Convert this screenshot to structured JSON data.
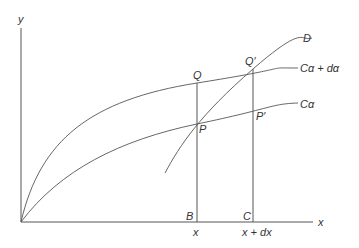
{
  "diagram": {
    "axes": {
      "x_label": "x",
      "y_label": "y"
    },
    "curves": [
      {
        "id": "c_alpha",
        "label": "Cα"
      },
      {
        "id": "c_alpha_dalpha",
        "label": "Cα + dα"
      },
      {
        "id": "d_curve",
        "label": "D"
      }
    ],
    "points": {
      "P": "P",
      "Q": "Q",
      "Q_prime": "Q′",
      "P_prime": "P′",
      "B": "B",
      "C": "C"
    },
    "ticks": {
      "x": "x",
      "x_dx": "x + dx"
    }
  }
}
